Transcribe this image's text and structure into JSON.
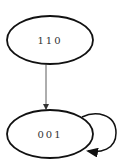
{
  "diagram": {
    "type": "state-transition-graph",
    "nodes": [
      {
        "id": "n110",
        "label": "110"
      },
      {
        "id": "n001",
        "label": "001"
      }
    ],
    "edges": [
      {
        "from": "110",
        "to": "001"
      },
      {
        "from": "001",
        "to": "001",
        "self_loop": true
      }
    ],
    "colors": {
      "stroke": "#111111",
      "text": "#333333",
      "background": "#ffffff"
    }
  }
}
